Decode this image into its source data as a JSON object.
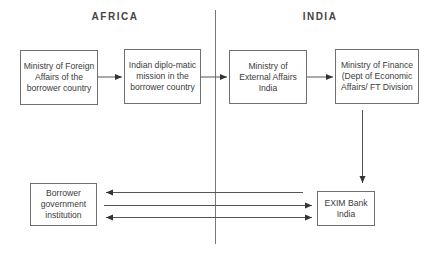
{
  "regions": {
    "africa": "AFRICA",
    "india": "INDIA"
  },
  "boxes": {
    "mofa_borrower": "Ministry of Foreign Affairs of the borrower country",
    "indian_mission": "Indian diplo-matic mission in the borrower country",
    "mea_india": "Ministry of External Affairs India",
    "mof_india": "Ministry of Finance (Dept of Economic Affairs/ FT Division",
    "borrower_institution": "Borrower government institution",
    "exim_bank": "EXIM Bank India"
  },
  "colors": {
    "line": "#555555",
    "box_border": "#6f6f6f",
    "divider": "#777777"
  }
}
